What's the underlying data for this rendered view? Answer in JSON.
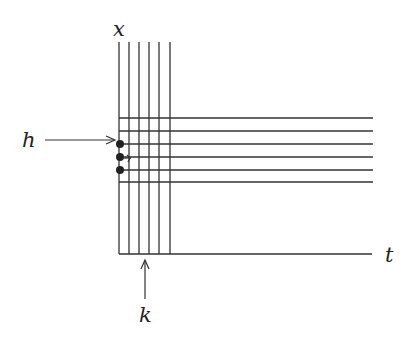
{
  "diagram": {
    "labels": {
      "vertical_axis": "x",
      "horizontal_axis": "t",
      "h_arrow": "h",
      "k_arrow": "k"
    },
    "grid": {
      "vertical_line_count": 6,
      "horizontal_line_count": 6
    },
    "marked_points": 3,
    "small_arrow_count": 1,
    "colors": {
      "line": "#333333",
      "text": "#222222",
      "background": "#ffffff"
    }
  }
}
